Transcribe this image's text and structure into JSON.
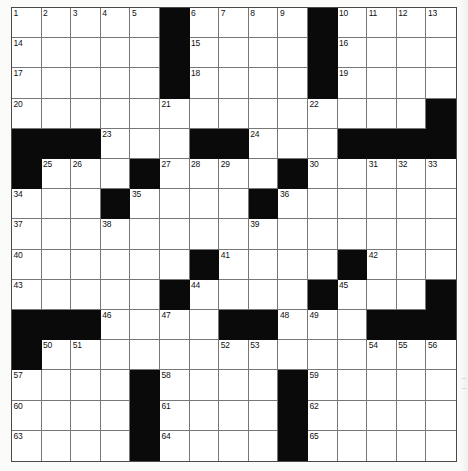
{
  "puzzle": {
    "kind": "crossword-grid",
    "rows": 15,
    "columns": 15,
    "colors": {
      "block": "#0a0a0a",
      "cell": "#ffffff",
      "rule": "#777777",
      "border": "#4a4a4a",
      "number": "#111111",
      "paper": "#fbfbf9"
    },
    "numbers_across_total": 65,
    "grid": [
      [
        "1",
        "2",
        "3",
        "4",
        "5",
        "#",
        "6",
        "7",
        "8",
        "9",
        "#",
        "10",
        "11",
        "12",
        "13"
      ],
      [
        "14",
        "",
        "",
        "",
        "",
        "#",
        "15",
        "",
        "",
        "",
        "#",
        "16",
        "",
        "",
        ""
      ],
      [
        "17",
        "",
        "",
        "",
        "",
        "#",
        "18",
        "",
        "",
        "",
        "#",
        "19",
        "",
        "",
        ""
      ],
      [
        "20",
        "",
        "",
        "",
        "",
        "21",
        "",
        "",
        "",
        "",
        "22",
        "",
        "",
        "",
        "#"
      ],
      [
        "#",
        "#",
        "#",
        "23",
        "",
        "",
        "#",
        "#",
        "24",
        "",
        "",
        "#",
        "#",
        "#",
        "#"
      ],
      [
        "#",
        "25",
        "26",
        "",
        "#",
        "27",
        "28",
        "29",
        "",
        "#",
        "30",
        "",
        "31",
        "32",
        "33"
      ],
      [
        "34",
        "",
        "",
        "#",
        "35",
        "",
        "",
        "",
        "#",
        "36",
        "",
        "",
        "",
        "",
        ""
      ],
      [
        "37",
        "",
        "",
        "38",
        "",
        "",
        "",
        "",
        "39",
        "",
        "",
        "",
        "",
        "",
        ""
      ],
      [
        "40",
        "",
        "",
        "",
        "",
        "",
        "#",
        "41",
        "",
        "",
        "",
        "#",
        "42",
        "",
        ""
      ],
      [
        "43",
        "",
        "",
        "",
        "",
        "#",
        "44",
        "",
        "",
        "",
        "#",
        "45",
        "",
        "",
        "#"
      ],
      [
        "#",
        "#",
        "#",
        "46",
        "",
        "47",
        "",
        "#",
        "#",
        "48",
        "49",
        "",
        "#",
        "#",
        "#"
      ],
      [
        "#",
        "50",
        "51",
        "",
        "",
        "",
        "",
        "52",
        "53",
        "",
        "",
        "",
        "54",
        "55",
        "56"
      ],
      [
        "57",
        "",
        "",
        "",
        "#",
        "58",
        "",
        "",
        "",
        "#",
        "59",
        "",
        "",
        "",
        ""
      ],
      [
        "60",
        "",
        "",
        "",
        "#",
        "61",
        "",
        "",
        "",
        "#",
        "62",
        "",
        "",
        "",
        ""
      ],
      [
        "63",
        "",
        "",
        "",
        "#",
        "64",
        "",
        "",
        "",
        "#",
        "65",
        "",
        "",
        "",
        ""
      ]
    ],
    "clue_numbers": [
      "1",
      "2",
      "3",
      "4",
      "5",
      "6",
      "7",
      "8",
      "9",
      "10",
      "11",
      "12",
      "13",
      "14",
      "15",
      "16",
      "17",
      "18",
      "19",
      "20",
      "21",
      "22",
      "23",
      "24",
      "25",
      "26",
      "27",
      "28",
      "29",
      "30",
      "31",
      "32",
      "33",
      "34",
      "35",
      "36",
      "37",
      "38",
      "39",
      "40",
      "41",
      "42",
      "43",
      "44",
      "45",
      "46",
      "47",
      "48",
      "49",
      "50",
      "51",
      "52",
      "53",
      "54",
      "55",
      "56",
      "57",
      "58",
      "59",
      "60",
      "61",
      "62",
      "63",
      "64",
      "65"
    ]
  }
}
